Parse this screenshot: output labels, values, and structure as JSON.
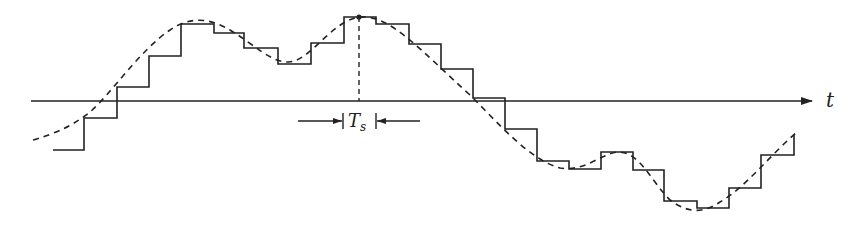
{
  "diagram": {
    "axis": {
      "label": "t",
      "y": 101,
      "x_start": 31,
      "x_end": 812
    },
    "sample_period": {
      "symbol": "T",
      "subscript": "s",
      "y": 121
    },
    "colors": {
      "stroke": "#222222",
      "background": "#ffffff"
    },
    "staircase_signal": {
      "style": "solid",
      "description": "held sample values",
      "steps": [
        {
          "x0": 53,
          "x1": 84,
          "y": 150
        },
        {
          "x0": 84,
          "x1": 117,
          "y": 118
        },
        {
          "x0": 117,
          "x1": 149,
          "y": 87
        },
        {
          "x0": 149,
          "x1": 181,
          "y": 56
        },
        {
          "x0": 181,
          "x1": 214,
          "y": 24
        },
        {
          "x0": 214,
          "x1": 244,
          "y": 33
        },
        {
          "x0": 244,
          "x1": 278,
          "y": 48
        },
        {
          "x0": 278,
          "x1": 311,
          "y": 64
        },
        {
          "x0": 311,
          "x1": 344,
          "y": 43
        },
        {
          "x0": 344,
          "x1": 376,
          "y": 17
        },
        {
          "x0": 376,
          "x1": 409,
          "y": 24
        },
        {
          "x0": 409,
          "x1": 441,
          "y": 44
        },
        {
          "x0": 441,
          "x1": 473,
          "y": 69
        },
        {
          "x0": 473,
          "x1": 505,
          "y": 98
        },
        {
          "x0": 505,
          "x1": 537,
          "y": 129
        },
        {
          "x0": 537,
          "x1": 569,
          "y": 161
        },
        {
          "x0": 569,
          "x1": 601,
          "y": 169
        },
        {
          "x0": 601,
          "x1": 633,
          "y": 152
        },
        {
          "x0": 633,
          "x1": 664,
          "y": 170
        },
        {
          "x0": 664,
          "x1": 697,
          "y": 201
        },
        {
          "x0": 697,
          "x1": 729,
          "y": 208
        },
        {
          "x0": 729,
          "x1": 761,
          "y": 188
        },
        {
          "x0": 761,
          "x1": 794,
          "y": 155
        }
      ],
      "final_rise_to_y": 135
    },
    "continuous_signal": {
      "style": "dashed",
      "description": "original analog signal",
      "path": "M 33 140 C 60 132, 75 124, 90 112 C 110 95, 140 50, 170 30 C 190 16, 210 18, 230 30 C 255 45, 270 62, 288 62 C 310 62, 330 22, 359 17 C 390 14, 420 50, 470 95 C 500 125, 530 160, 560 168 C 585 172, 600 154, 618 152 C 640 152, 650 180, 670 200 C 690 215, 705 212, 720 202 C 745 188, 770 155, 797 132"
    },
    "highlighted_sample": {
      "x": 359,
      "y": 17,
      "dashed_drop_to_axis": true
    }
  }
}
